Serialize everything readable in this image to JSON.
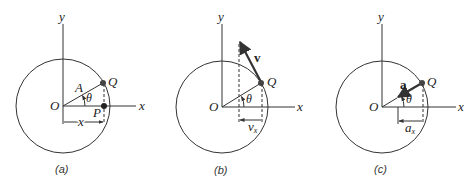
{
  "panels": [
    {
      "id": "a",
      "caption": "(a)",
      "axis_x_label": "x",
      "axis_y_label": "y",
      "origin_label": "O",
      "point_q_label": "Q",
      "point_p_label": "P",
      "radius_label": "A",
      "angle_label": "θ",
      "dimension_label": "x"
    },
    {
      "id": "b",
      "caption": "(b)",
      "axis_x_label": "x",
      "axis_y_label": "y",
      "origin_label": "O",
      "point_q_label": "Q",
      "angle_label": "θ",
      "vector_label": "v",
      "component_label_main": "v",
      "component_label_sub": "x"
    },
    {
      "id": "c",
      "caption": "(c)",
      "axis_x_label": "x",
      "axis_y_label": "y",
      "origin_label": "O",
      "point_q_label": "Q",
      "angle_label": "θ",
      "vector_label": "a",
      "component_label_main": "a",
      "component_label_sub": "x"
    }
  ],
  "colors": {
    "line": "#333333",
    "point": "#444444",
    "background": "#ffffff"
  }
}
